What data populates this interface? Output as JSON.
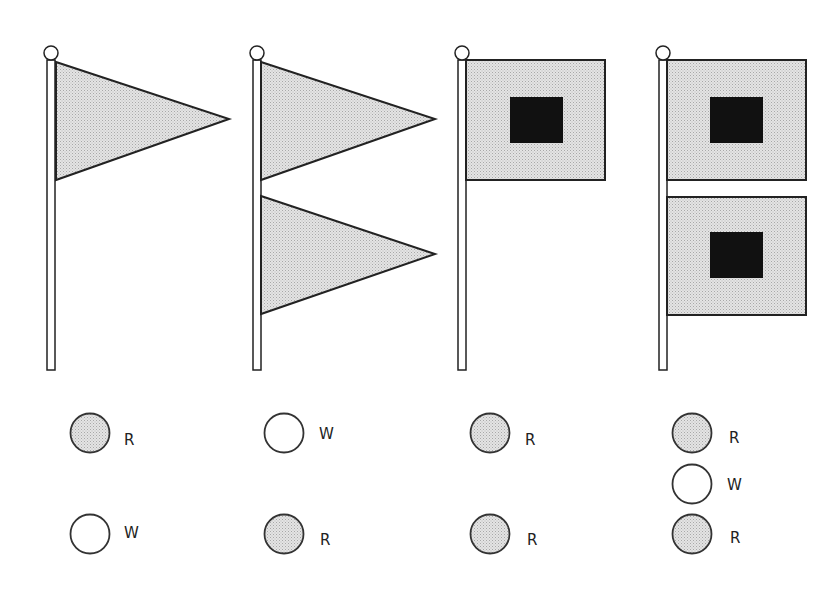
{
  "diagram": {
    "colors": {
      "flag_fill": "#d9d9d9",
      "stroke": "#222222",
      "square": "#111111",
      "red_light": "#d4d4d4",
      "white_light": "#ffffff"
    },
    "columns": [
      {
        "id": "col1",
        "flag": "single pennant",
        "lights": [
          {
            "color": "red",
            "label": "R"
          },
          {
            "color": "white",
            "label": "W"
          }
        ]
      },
      {
        "id": "col2",
        "flag": "two pennants",
        "lights": [
          {
            "color": "white",
            "label": "W"
          },
          {
            "color": "red",
            "label": "R"
          }
        ]
      },
      {
        "id": "col3",
        "flag": "single square flag with black center",
        "lights": [
          {
            "color": "red",
            "label": "R"
          },
          {
            "color": "red",
            "label": "R"
          }
        ]
      },
      {
        "id": "col4",
        "flag": "two square flags with black centers",
        "lights": [
          {
            "color": "red",
            "label": "R"
          },
          {
            "color": "white",
            "label": "W"
          },
          {
            "color": "red",
            "label": "R"
          }
        ]
      }
    ]
  }
}
